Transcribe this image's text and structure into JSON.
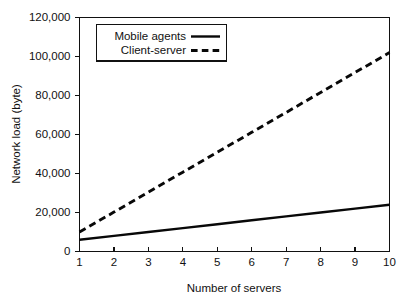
{
  "chart_data": {
    "type": "line",
    "title": "",
    "xlabel": "Number of servers",
    "ylabel": "Network load (byte)",
    "xlim": [
      1,
      10
    ],
    "ylim": [
      0,
      120000
    ],
    "grid": false,
    "legend_position": "top-left",
    "x": [
      1,
      2,
      3,
      4,
      5,
      6,
      7,
      8,
      9,
      10
    ],
    "xticks": [
      "1",
      "2",
      "3",
      "4",
      "5",
      "6",
      "7",
      "8",
      "9",
      "10"
    ],
    "yticks": [
      "0",
      "20,000",
      "40,000",
      "60,000",
      "80,000",
      "100,000",
      "120,000"
    ],
    "ytick_values": [
      0,
      20000,
      40000,
      60000,
      80000,
      100000,
      120000
    ],
    "series": [
      {
        "name": "Mobile agents",
        "style": "solid",
        "color": "#080808",
        "values": [
          6000,
          8000,
          10000,
          12000,
          14000,
          16000,
          18000,
          20000,
          22000,
          24000
        ]
      },
      {
        "name": "Client-server",
        "style": "dashed",
        "color": "#080808",
        "values": [
          10000,
          20200,
          30400,
          40700,
          50900,
          61100,
          71300,
          81600,
          91800,
          102000
        ]
      }
    ]
  },
  "legend": {
    "items": [
      {
        "label": "Mobile agents",
        "style": "solid"
      },
      {
        "label": "Client-server",
        "style": "dashed"
      }
    ]
  },
  "figure": {
    "background": "#ffffff",
    "foreground": "#111111"
  }
}
